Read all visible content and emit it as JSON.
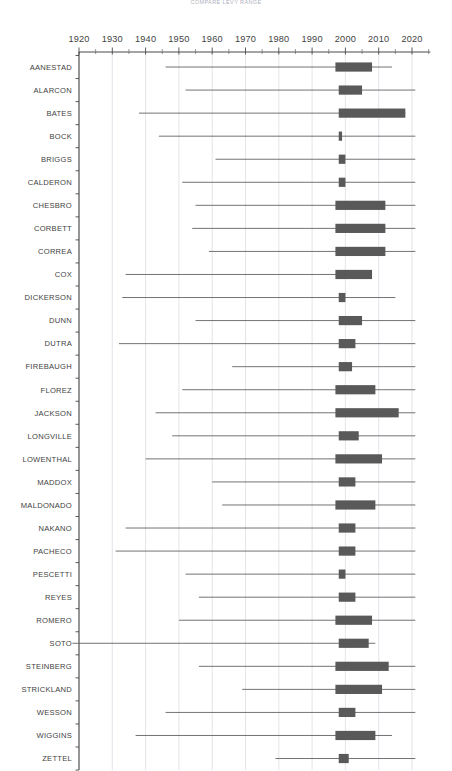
{
  "chart_data": {
    "type": "bar",
    "subtype": "range-bar-with-whiskers",
    "title": "COMPARE LEVY RANGE",
    "xlabel": "",
    "ylabel": "",
    "xlim": [
      1916,
      2025
    ],
    "grid": true,
    "grid_axis": "x",
    "legend": "none",
    "orientation": "horizontal",
    "bar_color": "#595959",
    "whisker_color": "#5a5a5a",
    "gridline_color": "#d9d9e2",
    "axis_color": "#4a4a4a",
    "xticks": [
      1920,
      1930,
      1940,
      1950,
      1960,
      1970,
      1980,
      1990,
      2000,
      2010,
      2020
    ],
    "xtick_labels": [
      "1920",
      "1930",
      "1940",
      "1950",
      "1960",
      "1970",
      "1980",
      "1990",
      "2000",
      "2010",
      "2020"
    ],
    "minor_tick_interval": 5,
    "categories": [
      "AANESTAD",
      "ALARCON",
      "BATES",
      "BOCK",
      "BRIGGS",
      "CALDERON",
      "CHESBRO",
      "CORBETT",
      "CORREA",
      "COX",
      "DICKERSON",
      "DUNN",
      "DUTRA",
      "FIREBAUGH",
      "FLOREZ",
      "JACKSON",
      "LONGVILLE",
      "LOWENTHAL",
      "MADDOX",
      "MALDONADO",
      "NAKANO",
      "PACHECO",
      "PESCETTI",
      "REYES",
      "ROMERO",
      "SOTO",
      "STEINBERG",
      "STRICKLAND",
      "WESSON",
      "WIGGINS",
      "ZETTEL"
    ],
    "series": [
      {
        "name": "range",
        "bar_start": [
          1997,
          1998,
          1998,
          1998,
          1998,
          1998,
          1997,
          1997,
          1997,
          1997,
          1998,
          1998,
          1998,
          1998,
          1997,
          1997,
          1998,
          1997,
          1998,
          1997,
          1998,
          1998,
          1998,
          1998,
          1997,
          1998,
          1997,
          1997,
          1998,
          1997,
          1998
        ],
        "bar_end": [
          2008,
          2005,
          2018,
          1999,
          2000,
          2000,
          2012,
          2012,
          2012,
          2008,
          2000,
          2005,
          2003,
          2002,
          2009,
          2016,
          2004,
          2011,
          2003,
          2009,
          2003,
          2003,
          2000,
          2003,
          2008,
          2007,
          2013,
          2011,
          2003,
          2009,
          2001
        ],
        "whisker_low": [
          1946,
          1952,
          1938,
          1944,
          1961,
          1951,
          1955,
          1954,
          1959,
          1934,
          1933,
          1955,
          1932,
          1966,
          1951,
          1943,
          1948,
          1940,
          1960,
          1963,
          1934,
          1931,
          1952,
          1956,
          1950,
          1918,
          1956,
          1969,
          1946,
          1937,
          1979
        ],
        "whisker_high": [
          2014,
          2021,
          2018,
          2021,
          2021,
          2021,
          2021,
          2021,
          2021,
          2008,
          2015,
          2021,
          2021,
          2021,
          2021,
          2021,
          2021,
          2021,
          2021,
          2021,
          2021,
          2021,
          2021,
          2021,
          2021,
          2009,
          2021,
          2021,
          2021,
          2014,
          2021
        ]
      }
    ]
  }
}
